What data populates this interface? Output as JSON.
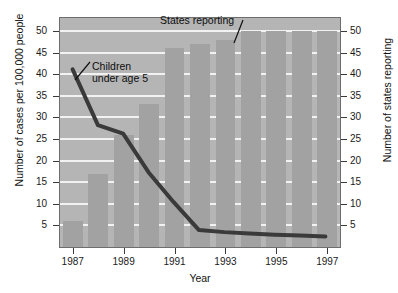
{
  "chart_data": {
    "type": "bar",
    "title": "",
    "xlabel": "Year",
    "ylabel": "Number of cases per 100,000 people",
    "y2label": "Number of states reporting",
    "grid": true,
    "legend_position": "none",
    "x": [
      1987,
      1988,
      1989,
      1990,
      1991,
      1992,
      1993,
      1994,
      1995,
      1996,
      1997
    ],
    "categories": [
      "1987",
      "1988",
      "1989",
      "1990",
      "1991",
      "1992",
      "1993",
      "1994",
      "1995",
      "1996",
      "1997"
    ],
    "xlim": [
      1986.5,
      1997.5
    ],
    "ylim": [
      0,
      53
    ],
    "y2lim": [
      0,
      53
    ],
    "yticks": [
      5,
      10,
      15,
      20,
      25,
      30,
      35,
      40,
      45,
      50
    ],
    "y2ticks": [
      5,
      10,
      15,
      20,
      25,
      30,
      35,
      40,
      45,
      50
    ],
    "xticks": [
      1987,
      1989,
      1991,
      1993,
      1995,
      1997
    ],
    "xticklabels": [
      "1987",
      "1989",
      "1991",
      "1993",
      "1995",
      "1997"
    ],
    "series": [
      {
        "name": "States reporting",
        "type": "bar",
        "axis": "right",
        "color": "#a2a2a2",
        "values": [
          6,
          17,
          26,
          33,
          46,
          47,
          48,
          50,
          50,
          50,
          50
        ]
      },
      {
        "name": "Children under age 5",
        "type": "line",
        "axis": "left",
        "color": "#3a3a3a",
        "values": [
          41,
          28,
          26,
          17,
          10,
          3.5,
          3,
          2.7,
          2.4,
          2.2,
          2
        ]
      }
    ],
    "annotations": [
      {
        "name": "states-reporting",
        "text": "States reporting",
        "points_to_year": 1994
      },
      {
        "name": "children-under-5",
        "text_line1": "Children",
        "text_line2": "under age 5",
        "points_to_year": 1987
      }
    ]
  },
  "axes": {
    "left": {
      "title": "Number of cases per 100,000 people",
      "ticks": [
        "50",
        "45",
        "40",
        "35",
        "30",
        "25",
        "20",
        "15",
        "10",
        "5"
      ]
    },
    "right": {
      "title": "Number of states reporting",
      "ticks": [
        "50",
        "45",
        "40",
        "35",
        "30",
        "25",
        "20",
        "15",
        "10",
        "5"
      ]
    },
    "bottom": {
      "title": "Year",
      "ticks": [
        "1987",
        "1989",
        "1991",
        "1993",
        "1995",
        "1997"
      ]
    }
  },
  "annotations": {
    "states_reporting": "States reporting",
    "children_line1": "Children",
    "children_line2": "under age 5"
  },
  "colors": {
    "plot_background": "#b5b5b5",
    "bar": "#a2a2a2",
    "gridline": "#f2f2f2",
    "line": "#3a3a3a",
    "axis": "#6d6d6d",
    "text": "#111111"
  }
}
